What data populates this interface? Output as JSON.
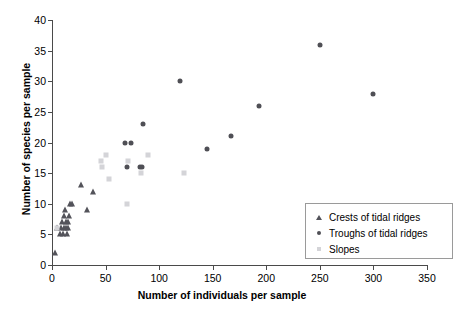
{
  "chart_data": {
    "type": "scatter",
    "title": "",
    "xlabel": "Number of individuals per sample",
    "ylabel": "Number of species per sample",
    "xlim": [
      0,
      350
    ],
    "ylim": [
      0,
      40
    ],
    "xticks": [
      0,
      50,
      100,
      150,
      200,
      250,
      300,
      350
    ],
    "yticks": [
      0,
      5,
      10,
      15,
      20,
      25,
      30,
      35,
      40
    ],
    "grid": false,
    "legend_position": "lower right",
    "series": [
      {
        "name": "Crests of tidal ridges",
        "marker": "triangle",
        "color": "#53535a",
        "points": [
          [
            3,
            2
          ],
          [
            5,
            6
          ],
          [
            7,
            5
          ],
          [
            8,
            6
          ],
          [
            9,
            7
          ],
          [
            10,
            5
          ],
          [
            11,
            6
          ],
          [
            11,
            8
          ],
          [
            12,
            9
          ],
          [
            13,
            6
          ],
          [
            13,
            7
          ],
          [
            14,
            5
          ],
          [
            15,
            6
          ],
          [
            15,
            7
          ],
          [
            16,
            8
          ],
          [
            17,
            10
          ],
          [
            19,
            10
          ],
          [
            27,
            13
          ],
          [
            33,
            9
          ],
          [
            38,
            12
          ]
        ]
      },
      {
        "name": "Troughs of tidal ridges",
        "marker": "circle",
        "color": "#4f4f55",
        "points": [
          [
            68,
            20
          ],
          [
            74,
            20
          ],
          [
            70,
            16
          ],
          [
            82,
            16
          ],
          [
            84,
            16
          ],
          [
            85,
            23
          ],
          [
            119,
            30
          ],
          [
            145,
            19
          ],
          [
            167,
            21
          ],
          [
            193,
            26
          ],
          [
            250,
            36
          ],
          [
            300,
            28
          ]
        ]
      },
      {
        "name": "Slopes",
        "marker": "square",
        "color": "#d4d4d8",
        "points": [
          [
            5,
            6
          ],
          [
            46,
            17
          ],
          [
            47,
            16
          ],
          [
            50,
            18
          ],
          [
            53,
            14
          ],
          [
            70,
            10
          ],
          [
            71,
            17
          ],
          [
            83,
            15
          ],
          [
            90,
            18
          ],
          [
            123,
            15
          ]
        ]
      }
    ]
  },
  "legend": {
    "items": [
      {
        "label": "Crests of tidal ridges",
        "marker": "triangle"
      },
      {
        "label": "Troughs of tidal ridges",
        "marker": "circle"
      },
      {
        "label": "Slopes",
        "marker": "square"
      }
    ]
  },
  "colors": {
    "axis": "#4a4a4a",
    "triangle": "#53535a",
    "circle": "#4f4f55",
    "square": "#d4d4d8",
    "legend_border": "#9a9a9a",
    "background": "#ffffff"
  }
}
